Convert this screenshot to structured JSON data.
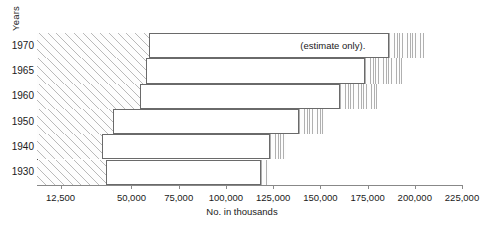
{
  "chart_data": {
    "type": "bar",
    "orientation": "horizontal",
    "title": "",
    "xlabel": "No. in thousands",
    "ylabel": "Years",
    "categories": [
      "1970",
      "1965",
      "1960",
      "1950",
      "1940",
      "1930"
    ],
    "values": [
      205000,
      193000,
      180000,
      152000,
      132000,
      123000
    ],
    "series": [
      {
        "name": "established",
        "values": [
          60000,
          58000,
          55000,
          41000,
          35000,
          37000
        ]
      },
      {
        "name": "projected",
        "values": [
          186000,
          173000,
          160000,
          138000,
          123000,
          118000
        ]
      }
    ],
    "xlim": [
      0,
      225000
    ],
    "xticks": [
      12500,
      50000,
      75000,
      100000,
      125000,
      150000,
      175000,
      200000,
      225000
    ],
    "xtick_labels": [
      "12,500",
      "50,000",
      "75,000",
      "100,000",
      "125,000",
      "150,000",
      "175,000",
      "200,000",
      "225,000"
    ],
    "grid": false,
    "legend": "none",
    "annotations": [
      {
        "text": "(estimate only).",
        "row": "1970"
      }
    ]
  },
  "axes": {
    "y_title": "Years",
    "x_title": "No. in thousands"
  },
  "rows": [
    {
      "year": "1970",
      "bar_end": 205000,
      "diag_end": 60000,
      "vert_start": 186000
    },
    {
      "year": "1965",
      "bar_end": 193000,
      "diag_end": 58000,
      "vert_start": 173000
    },
    {
      "year": "1960",
      "bar_end": 180000,
      "diag_end": 55000,
      "vert_start": 160000
    },
    {
      "year": "1950",
      "bar_end": 152000,
      "diag_end": 41000,
      "vert_start": 138000
    },
    {
      "year": "1940",
      "bar_end": 132000,
      "diag_end": 35000,
      "vert_start": 123000
    },
    {
      "year": "1930",
      "bar_end": 123000,
      "diag_end": 37000,
      "vert_start": 118000
    }
  ],
  "annotation": {
    "estimate_note": "(estimate only)."
  },
  "xticks": [
    {
      "value": 12500,
      "label": "12,500"
    },
    {
      "value": 50000,
      "label": "50,000"
    },
    {
      "value": 75000,
      "label": "75,000"
    },
    {
      "value": 100000,
      "label": "100,000"
    },
    {
      "value": 125000,
      "label": "125,000"
    },
    {
      "value": 150000,
      "label": "150,000"
    },
    {
      "value": 175000,
      "label": "175,000"
    },
    {
      "value": 200000,
      "label": "200,000"
    },
    {
      "value": 225000,
      "label": "225,000"
    }
  ],
  "colors": {
    "line": "#6a6a6a",
    "hatch": "#b9b9b9",
    "text": "#1a1a1a",
    "background": "#ffffff"
  }
}
